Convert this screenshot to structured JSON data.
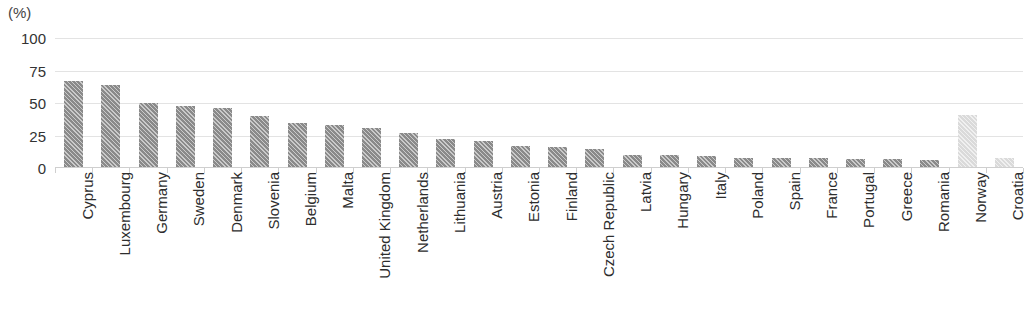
{
  "chart_data": {
    "type": "bar",
    "title": "",
    "subtitle": "",
    "unit_label": "(%)",
    "xlabel": "",
    "ylabel": "",
    "ylim": [
      0,
      100
    ],
    "yticks": [
      0,
      25,
      50,
      75,
      100
    ],
    "ytick_labels": [
      "0",
      "25",
      "50",
      "75",
      "100"
    ],
    "grid": true,
    "grid_axis": "y",
    "legend": "none",
    "categories": [
      "Cyprus",
      "Luxembourg",
      "Germany",
      "Sweden",
      "Denmark",
      "Slovenia",
      "Belgium",
      "Malta",
      "United Kingdom",
      "Netherlands",
      "Lithuania",
      "Austria",
      "Estonia",
      "Finland",
      "Czech Republic",
      "Latvia",
      "Hungary",
      "Italy",
      "Poland",
      "Spain",
      "France",
      "Portugal",
      "Greece",
      "Romania",
      "Norway",
      "Croatia"
    ],
    "values": [
      67,
      64,
      50,
      48,
      46,
      40,
      35,
      33,
      31,
      27,
      22,
      21,
      17,
      16,
      15,
      10,
      10,
      9,
      8,
      8,
      8,
      7,
      7,
      6,
      41,
      8
    ],
    "bar_styles": [
      "dark",
      "dark",
      "dark",
      "dark",
      "dark",
      "dark",
      "dark",
      "dark",
      "dark",
      "dark",
      "dark",
      "dark",
      "dark",
      "dark",
      "dark",
      "dark",
      "dark",
      "dark",
      "dark",
      "dark",
      "dark",
      "dark",
      "dark",
      "dark",
      "light",
      "light"
    ],
    "colors": {
      "bar_dark": "#8a8a8a",
      "bar_light": "#dadada",
      "gridline": "#e3e3e3",
      "axis": "#cfcfcf",
      "text": "#333333"
    }
  }
}
